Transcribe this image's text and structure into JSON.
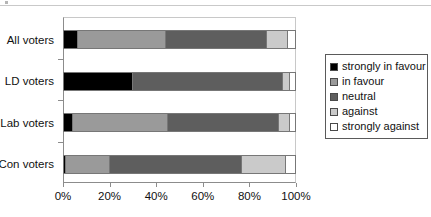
{
  "chart_data": {
    "type": "bar",
    "orientation": "horizontal",
    "stacked": true,
    "stack_mode": "percent",
    "title": "",
    "xlabel": "",
    "ylabel": "",
    "categories": [
      "All voters",
      "LD voters",
      "Lab voters",
      "Con voters"
    ],
    "category_order_top_to_bottom": [
      "All voters",
      "LD voters",
      "Lab voters",
      "Con voters"
    ],
    "series": [
      {
        "name": "strongly in favour",
        "color": "#000000",
        "values": [
          6,
          30,
          4,
          1
        ]
      },
      {
        "name": "in favour",
        "color": "#9a9a9a",
        "values": [
          38,
          0,
          41,
          19
        ]
      },
      {
        "name": "neutral",
        "color": "#5e5e5e",
        "values": [
          44,
          65,
          48,
          57
        ]
      },
      {
        "name": "against",
        "color": "#cacaca",
        "values": [
          9,
          3,
          5,
          19
        ]
      },
      {
        "name": "strongly against",
        "color": "#ffffff",
        "values": [
          3,
          2,
          2,
          4
        ]
      }
    ],
    "xticks": [
      0,
      20,
      40,
      60,
      80,
      100
    ],
    "xtick_labels": [
      "0%",
      "20%",
      "40%",
      "60%",
      "80%",
      "100%"
    ],
    "xlim": [
      0,
      100
    ],
    "grid": false,
    "legend": {
      "position": "right",
      "entries": [
        "strongly in favour",
        "in favour",
        "neutral",
        "against",
        "strongly against"
      ]
    }
  },
  "colors": {
    "strongly_in_favour": "#000000",
    "in_favour": "#9a9a9a",
    "neutral": "#5e5e5e",
    "against": "#cacaca",
    "strongly_against": "#ffffff",
    "axis": "#8c8c8c",
    "text": "#111111"
  }
}
